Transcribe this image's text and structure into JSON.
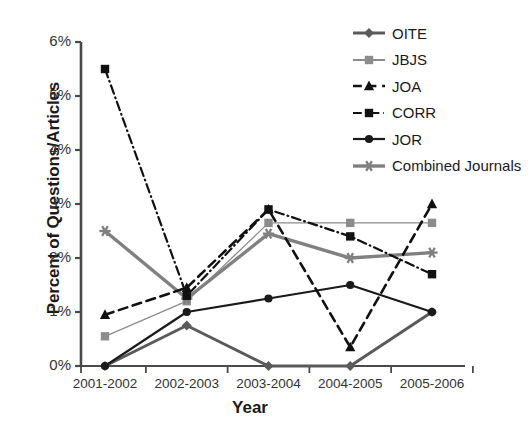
{
  "chart_data": {
    "type": "line",
    "title": "",
    "xlabel": "Year",
    "ylabel": "Percent of Questions/Articles",
    "categories": [
      "2001-2002",
      "2002-2003",
      "2003-2004",
      "2004-2005",
      "2005-2006"
    ],
    "ylim": [
      0,
      6
    ],
    "ytick_labels": [
      "0%",
      "1%",
      "2%",
      "3%",
      "4%",
      "5%",
      "6%"
    ],
    "ytick_values": [
      0,
      1,
      2,
      3,
      4,
      5,
      6
    ],
    "grid": false,
    "legend_position": "top-right",
    "units": "percent",
    "series": [
      {
        "name": "OITE",
        "values": [
          0,
          0.75,
          0,
          0,
          1.0
        ],
        "color": "#5a5a5a",
        "marker": "diamond",
        "line_style": "solid",
        "line_width": 3
      },
      {
        "name": "JBJS",
        "values": [
          0.55,
          1.2,
          2.65,
          2.65,
          2.65
        ],
        "color": "#8c8c8c",
        "marker": "square",
        "line_style": "solid",
        "line_width": 1.3
      },
      {
        "name": "JOA",
        "values": [
          0.95,
          1.45,
          2.9,
          0.35,
          3.0
        ],
        "color": "#111111",
        "marker": "triangle",
        "line_style": "dashed",
        "line_width": 2.6
      },
      {
        "name": "CORR",
        "values": [
          5.5,
          1.3,
          2.9,
          2.4,
          1.7
        ],
        "color": "#111111",
        "marker": "square",
        "line_style": "dash-dot",
        "line_width": 2.2
      },
      {
        "name": "JOR",
        "values": [
          0,
          1.0,
          1.25,
          1.5,
          1.0
        ],
        "color": "#1a1a1a",
        "marker": "circle",
        "line_style": "solid",
        "line_width": 2.2
      },
      {
        "name": "Combined Journals",
        "values": [
          2.5,
          1.25,
          2.45,
          2.0,
          2.1
        ],
        "color": "#808080",
        "marker": "asterisk",
        "line_style": "solid",
        "line_width": 3.4
      }
    ]
  },
  "legend": {
    "items": [
      {
        "label": "OITE"
      },
      {
        "label": "JBJS"
      },
      {
        "label": "JOA"
      },
      {
        "label": "CORR"
      },
      {
        "label": "JOR"
      },
      {
        "label": "Combined Journals"
      }
    ]
  }
}
